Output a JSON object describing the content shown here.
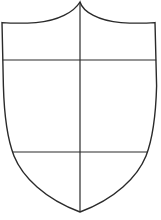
{
  "figure": {
    "name": "heraldic-shield-outline",
    "title": "Heraldic shield outline divided by a cross",
    "canvas": {
      "width": 161,
      "height": 220
    },
    "background_color": "#ffffff"
  },
  "style": {
    "line_color": "#2a2a2a",
    "fill_color": "#ffffff",
    "outline_stroke_width": 1.4,
    "division_stroke_width": 1.2
  },
  "shapes": {
    "shield_outline": {
      "name": "shield-body",
      "label": "Shield outline",
      "top_peak": {
        "x": 80,
        "y": 2
      },
      "top_left_corner": {
        "x": 2,
        "y": 23
      },
      "top_right_corner": {
        "x": 155,
        "y": 23
      },
      "bottom_point": {
        "x": 80,
        "y": 212
      },
      "path": "M 80 2 C 74 12 58 21 36 22.6 C 24 23.4 11 23.2 2 22.6 L 3.4 86 C 4.2 116 7 138 14 156 C 22.5 177 45 199 80 212 C 115 199 137.5 177 146 156 C 153 138 155.8 116 156.6 86 L 155 22.6 C 146 23.2 133 23.4 121 22.6 C 99 21 83 12 80 2 Z"
    },
    "pale_line": {
      "name": "vertical-division-line",
      "label": "Vertical division (pale)",
      "x": 80,
      "y_start": 2,
      "y_end": 212
    },
    "upper_fess_line": {
      "name": "upper-horizontal-division-line",
      "label": "Upper horizontal division (chief)",
      "y": 60,
      "x_start": 2.6,
      "x_end": 156.2
    },
    "lower_fess_line": {
      "name": "lower-horizontal-division-line",
      "label": "Lower horizontal division (base)",
      "y": 152,
      "x_start": 12.6,
      "x_end": 148.0
    }
  }
}
